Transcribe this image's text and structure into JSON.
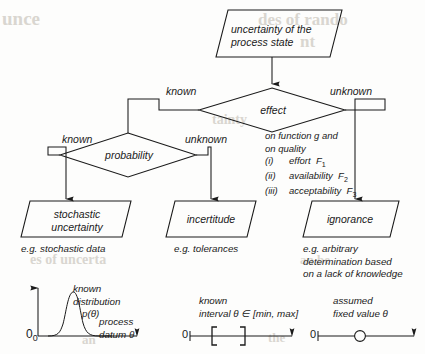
{
  "diagram": {
    "title_node": {
      "label": "uncertainty of the\nprocess state",
      "line1": "uncertainty of the",
      "line2": "process state"
    },
    "decisions": [
      {
        "id": "effect",
        "label": "effect"
      },
      {
        "id": "probability",
        "label": "probability"
      }
    ],
    "edge_labels": {
      "effect_left": "known",
      "effect_right": "unknown",
      "probability_left": "known",
      "probability_right": "unknown"
    },
    "outcomes": [
      {
        "id": "stochastic-uncertainty",
        "line1": "stochastic",
        "line2": "uncertainty",
        "caption": [
          "e.g. stochastic data"
        ]
      },
      {
        "id": "incertitude",
        "line1": "incertitude",
        "line2": "",
        "caption": [
          "e.g. tolerances"
        ]
      },
      {
        "id": "ignorance",
        "line1": "ignorance",
        "line2": "",
        "caption": [
          "e.g. arbitrary",
          "determination based",
          "on a lack of knowledge"
        ]
      }
    ],
    "annotation": {
      "line1": "on function g and",
      "line2": "on quality",
      "items": [
        {
          "numeral": "(i)",
          "text": "effort",
          "symbol": "F",
          "subscript": "1"
        },
        {
          "numeral": "(ii)",
          "text": "availability",
          "symbol": "F",
          "subscript": "2"
        },
        {
          "numeral": "(iii)",
          "text": "acceptability",
          "symbol": "F",
          "subscript": "3"
        }
      ]
    },
    "illustrations": [
      {
        "id": "distribution-plot",
        "kind": "pdf-curve",
        "label_lines": [
          "known",
          "distribution"
        ],
        "formula_sym": "p(θ)",
        "axis_lines": [
          "process",
          "datum θ"
        ],
        "origin": "0",
        "origin_sub": "0"
      },
      {
        "id": "interval-plot",
        "kind": "interval-brackets",
        "label_lines": [
          "known"
        ],
        "formula_sym": "interval  θ ∈ [min, max]",
        "origin": "0"
      },
      {
        "id": "fixed-value-plot",
        "kind": "single-point",
        "label_lines": [
          "assumed"
        ],
        "formula_sym": "fixed value θ",
        "origin": "0"
      }
    ],
    "bleed_text": [
      {
        "text": "unce",
        "x": 2,
        "y": 8,
        "size": 19
      },
      {
        "text": "des of rando",
        "x": 258,
        "y": 10,
        "size": 17
      },
      {
        "text": "nt",
        "x": 300,
        "y": 32,
        "size": 17
      },
      {
        "text": "tainty",
        "x": 212,
        "y": 112,
        "size": 14
      },
      {
        "text": "es of uncerta",
        "x": 30,
        "y": 252,
        "size": 14
      },
      {
        "text": "an be",
        "x": 300,
        "y": 252,
        "size": 13
      },
      {
        "text": "an",
        "x": 82,
        "y": 332,
        "size": 13
      },
      {
        "text": "the",
        "x": 268,
        "y": 330,
        "size": 13
      }
    ],
    "colors": {
      "stroke": "#1a1a1a",
      "background": "#fdfdfc",
      "bleed": "#d9d6d0"
    }
  }
}
